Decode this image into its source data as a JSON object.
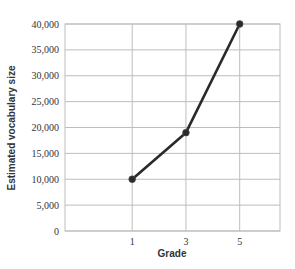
{
  "chart_data": {
    "type": "line",
    "title": "",
    "xlabel": "Grade",
    "ylabel": "Estimated vocabulary size",
    "categories": [
      "1",
      "3",
      "5"
    ],
    "x": [
      1,
      3,
      5
    ],
    "series": [
      {
        "name": "Estimated vocabulary size",
        "values": [
          10000,
          19000,
          40000
        ]
      }
    ],
    "values": [
      10000,
      19000,
      40000
    ],
    "ylim": [
      0,
      40000
    ],
    "xlim": [
      -1.5,
      6.5
    ],
    "yticks": [
      0,
      5000,
      10000,
      15000,
      20000,
      25000,
      30000,
      35000,
      40000
    ],
    "ytick_labels": [
      "0",
      "5,000",
      "10,000",
      "15,000",
      "20,000",
      "25,000",
      "30,000",
      "35,000",
      "40,000"
    ],
    "xticks": [
      1,
      3,
      5
    ],
    "xtick_labels": [
      "1",
      "3",
      "5"
    ],
    "grid": true,
    "legend": null,
    "colors": {
      "line": "#2a2a2a",
      "grid": "#bdbdbd",
      "text": "#333333"
    }
  }
}
